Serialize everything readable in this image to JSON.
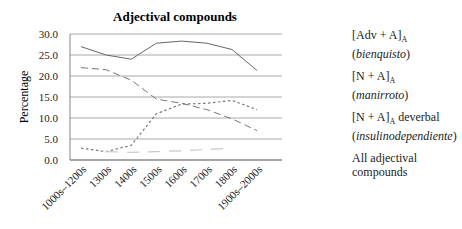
{
  "chart_data": {
    "type": "line",
    "title": "Adjectival compounds",
    "xlabel": "",
    "ylabel": "Percentage",
    "ylim": [
      0,
      30
    ],
    "yticks": [
      "30.0",
      "25.0",
      "20.0",
      "15.0",
      "10.0",
      "5.0",
      "0.0"
    ],
    "grid": true,
    "legend_position": "right",
    "categories": [
      "1000s–1200s",
      "1300s",
      "1400s",
      "1500s",
      "1600s",
      "1700s",
      "1800s",
      "1900s–2000s"
    ],
    "series": [
      {
        "name": "[Adv + A]A (bienquisto)",
        "style": "long-dash",
        "values": [
          22.0,
          21.5,
          19.0,
          14.5,
          13.5,
          12.0,
          9.8,
          7.0
        ]
      },
      {
        "name": "[N + A]A (manirroto)",
        "style": "short-dash",
        "values": [
          2.8,
          2.0,
          3.5,
          11.0,
          13.3,
          13.5,
          14.2,
          12.0
        ]
      },
      {
        "name": "[N + A]A deverbal (insulinodependiente)",
        "style": "light-dash",
        "values": [
          null,
          2.0,
          1.8,
          2.0,
          2.2,
          2.5,
          2.8,
          null
        ]
      },
      {
        "name": "All adjectival compounds",
        "style": "solid",
        "values": [
          27.0,
          25.0,
          24.0,
          27.8,
          28.3,
          27.8,
          26.3,
          21.3
        ]
      }
    ]
  },
  "legend": [
    {
      "main": "[Adv + A]",
      "sub": "A",
      "suffix": "",
      "example": "bienquisto"
    },
    {
      "main": "[N + A]",
      "sub": "A",
      "suffix": "",
      "example": "manirroto"
    },
    {
      "main": "[N + A]",
      "sub": "A",
      "suffix": " deverbal",
      "example": "insulinodependiente"
    },
    {
      "main": "All adjectival",
      "sub": "",
      "suffix": "",
      "example": "",
      "line2": "compounds"
    }
  ],
  "colors": {
    "grid": "#a8a8a8",
    "line": "#666666",
    "light": "#c8c8c8",
    "axis": "#888888"
  }
}
